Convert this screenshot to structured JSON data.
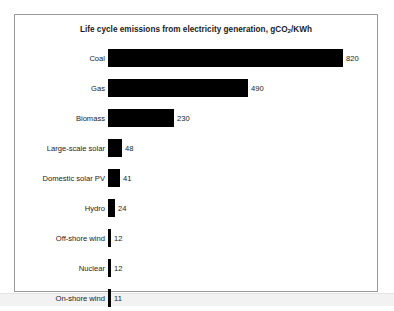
{
  "chart_data": {
    "type": "bar",
    "orientation": "horizontal",
    "title": "Life cycle emissions from electricity generation, gCO2/KWh",
    "title_parts": {
      "before_sub": "Life cycle emissions from electricity generation, gCO",
      "sub": "2",
      "after_sub": "/KWh"
    },
    "xlabel": "",
    "ylabel": "",
    "grid": false,
    "legend": null,
    "xlim": [
      0,
      820
    ],
    "bar_color": "#000000",
    "frame_color": "#9a9a9a",
    "background": "#ffffff",
    "categories": [
      "Coal",
      "Gas",
      "Biomass",
      "Large-scale solar",
      "Domestic solar PV",
      "Hydro",
      "Off-shore wind",
      "Nuclear",
      "On-shore wind"
    ],
    "values": [
      820,
      490,
      230,
      48,
      41,
      24,
      12,
      12,
      11
    ],
    "data_labels": [
      "820",
      "490",
      "230",
      "48",
      "41",
      "24",
      "12",
      "12",
      "11"
    ]
  }
}
